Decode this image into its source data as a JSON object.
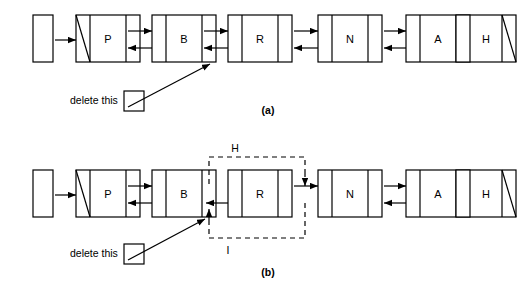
{
  "diagram": {
    "stroke_color": "#000000",
    "fill_color": "#ffffff",
    "panels": [
      {
        "caption": "(a)",
        "caption_x": 268,
        "caption_y": 111,
        "row_y": 15,
        "row_h": 47,
        "head_label": "",
        "nodes": [
          {
            "label": "P",
            "null_prev": true,
            "null_next": false
          },
          {
            "label": "B",
            "null_prev": false,
            "null_next": false
          },
          {
            "label": "R",
            "null_prev": false,
            "null_next": false
          },
          {
            "label": "N",
            "null_prev": false,
            "null_next": false
          },
          {
            "label": "A",
            "null_prev": false,
            "null_next": false
          },
          {
            "label": "H",
            "null_prev": false,
            "null_next": true
          }
        ],
        "annotation": {
          "label": "delete this",
          "label_x": 70,
          "label_y": 104,
          "box_x": 124,
          "box_y": 91,
          "box_w": 20,
          "box_h": 20,
          "arrow_from_x": 140,
          "arrow_from_y": 104,
          "arrow_to_x": 210,
          "arrow_to_y": 63
        },
        "dashed": []
      },
      {
        "caption": "(b)",
        "caption_x": 268,
        "caption_y": 272,
        "row_y": 170,
        "row_h": 47,
        "head_label": "",
        "nodes": [
          {
            "label": "P",
            "null_prev": true,
            "null_next": false
          },
          {
            "label": "B",
            "null_prev": false,
            "null_next": false
          },
          {
            "label": "R",
            "null_prev": false,
            "null_next": false
          },
          {
            "label": "N",
            "null_prev": false,
            "null_next": false
          },
          {
            "label": "A",
            "null_prev": false,
            "null_next": false
          },
          {
            "label": "H",
            "null_prev": false,
            "null_next": true
          }
        ],
        "annotation": {
          "label": "delete this",
          "label_x": 70,
          "label_y": 257,
          "box_x": 124,
          "box_y": 244,
          "box_w": 20,
          "box_h": 20,
          "arrow_from_x": 140,
          "arrow_from_y": 257,
          "arrow_to_x": 205,
          "arrow_to_y": 218
        },
        "dashed": [
          {
            "name": "H",
            "label": "H",
            "label_x": 235,
            "label_y": 152
          },
          {
            "name": "I",
            "label": "I",
            "label_x": 228,
            "label_y": 250
          }
        ]
      }
    ]
  }
}
